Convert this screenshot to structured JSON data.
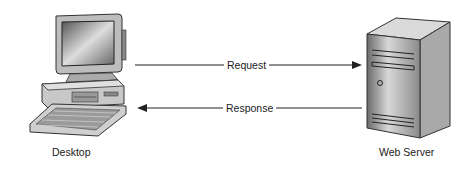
{
  "diagram": {
    "nodes": [
      {
        "id": "desktop",
        "label": "Desktop",
        "icon": "desktop-computer-icon"
      },
      {
        "id": "server",
        "label": "Web Server",
        "icon": "server-tower-icon"
      }
    ],
    "edges": [
      {
        "from": "desktop",
        "to": "server",
        "label": "Request"
      },
      {
        "from": "server",
        "to": "desktop",
        "label": "Response"
      }
    ]
  }
}
